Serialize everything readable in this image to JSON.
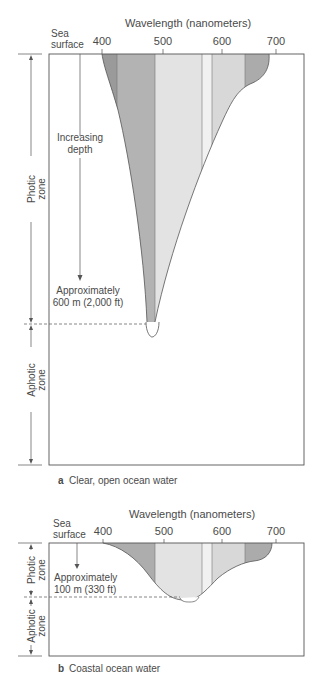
{
  "panel_a": {
    "axis_title": "Wavelength (nanometers)",
    "sea_surface_line1": "Sea",
    "sea_surface_line2": "surface",
    "ticks": [
      "400",
      "500",
      "600",
      "700"
    ],
    "increasing_depth_line1": "Increasing",
    "increasing_depth_line2": "depth",
    "depth_label_line1": "Approximately",
    "depth_label_line2": "600 m (2,000 ft)",
    "photic_line1": "Photic",
    "photic_line2": "zone",
    "aphotic_line1": "Aphotic",
    "aphotic_line2": "zone",
    "caption_letter": "a",
    "caption_text": "Clear, open ocean water"
  },
  "panel_b": {
    "axis_title": "Wavelength (nanometers)",
    "sea_surface_line1": "Sea",
    "sea_surface_line2": "surface",
    "ticks": [
      "400",
      "500",
      "600",
      "700"
    ],
    "depth_label_line1": "Approximately",
    "depth_label_line2": "100 m (330 ft)",
    "photic_line1": "Photic",
    "photic_line2": "zone",
    "aphotic_line1": "Aphotic",
    "aphotic_line2": "zone",
    "caption_letter": "b",
    "caption_text": "Coastal ocean water"
  },
  "colors": {
    "violet_band": "#9a9a9a",
    "blue_band": "#b4b4b4",
    "green_band": "#e2e2e2",
    "yellow_band": "#f0f0f0",
    "orange_band": "#d6d6d6",
    "red_band": "#adadad",
    "outline": "#555555"
  }
}
